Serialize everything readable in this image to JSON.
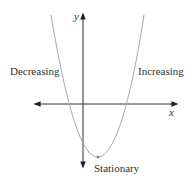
{
  "diagram": {
    "title": "",
    "type": "parabola-graph",
    "axes": {
      "x_label": "x",
      "y_label": "y"
    },
    "labels": {
      "left": "Decreasing",
      "right": "Increasing",
      "bottom": "Stationary"
    },
    "curve": {
      "shape": "upward parabola",
      "stationary_point": "minimum"
    },
    "colors": {
      "curve": "#a9a9a9",
      "axis": "#222222",
      "text": "#333333"
    }
  }
}
